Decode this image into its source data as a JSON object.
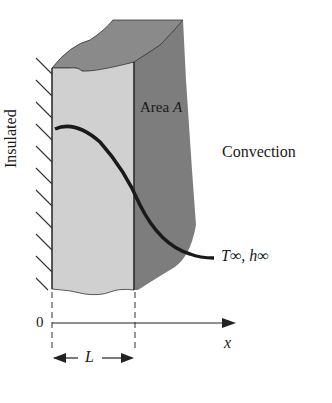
{
  "diagram": {
    "labels": {
      "area": "Area ",
      "area_symbol": "A",
      "convection": "Convection",
      "insulated": "Insulated",
      "t_inf": "T∞, h∞",
      "origin": "0",
      "x_axis": "x",
      "length": "L"
    },
    "colors": {
      "front_face": "#cfcfcf",
      "side_face": "#7a7a7a",
      "top_face": "#858585",
      "curve": "#1a1a1a",
      "lines": "#222222"
    }
  }
}
